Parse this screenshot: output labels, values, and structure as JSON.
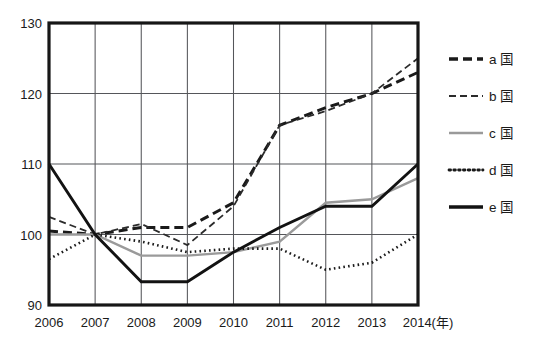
{
  "chart_data": {
    "type": "line",
    "title": "",
    "xlabel": "(年)",
    "ylabel": "",
    "x": [
      2006,
      2007,
      2008,
      2009,
      2010,
      2011,
      2012,
      2013,
      2014
    ],
    "categories": [
      "2006",
      "2007",
      "2008",
      "2009",
      "2010",
      "2011",
      "2012",
      "2013",
      "2014"
    ],
    "xlim": [
      2006,
      2014
    ],
    "ylim": [
      90,
      130
    ],
    "yticks": [
      90,
      100,
      110,
      120,
      130
    ],
    "ytick_labels": [
      "90",
      "100",
      "110",
      "120",
      "130"
    ],
    "grid": true,
    "legend_position": "right",
    "series": [
      {
        "name": "a 国",
        "label": "a 国",
        "style": "thick-dashed",
        "color": "#1a1a1a",
        "width": 3.0,
        "dash": "9,5",
        "values": [
          100.5,
          100,
          101,
          101,
          104.5,
          115.5,
          118,
          120,
          123
        ]
      },
      {
        "name": "b 国",
        "label": "b 国",
        "style": "thin-dashed",
        "color": "#2b2b2b",
        "width": 1.8,
        "dash": "7,4",
        "values": [
          102.5,
          100,
          101.5,
          98.5,
          104,
          115.5,
          117.5,
          120,
          125
        ]
      },
      {
        "name": "c 国",
        "label": "c 国",
        "style": "gray-solid",
        "color": "#9a9a9a",
        "width": 2.4,
        "dash": "none",
        "values": [
          100,
          100,
          97,
          97,
          97.5,
          99,
          104.5,
          105,
          108
        ]
      },
      {
        "name": "d 国",
        "label": "d 国",
        "style": "dotted",
        "color": "#1a1a1a",
        "width": 2.6,
        "dash": "1.6,3.2",
        "values": [
          96.5,
          100,
          99,
          97.5,
          98,
          98,
          95,
          96,
          100
        ]
      },
      {
        "name": "e 国",
        "label": "e 国",
        "style": "thick-solid",
        "color": "#121212",
        "width": 2.9,
        "dash": "none",
        "values": [
          110,
          100,
          93.3,
          93.3,
          97.5,
          101,
          104,
          104,
          110
        ]
      }
    ],
    "legend": [
      {
        "label": "a 国",
        "style": "thick-dashed",
        "color": "#1a1a1a",
        "width": 3.6,
        "dash": "9,5"
      },
      {
        "label": "b 国",
        "style": "thin-dashed",
        "color": "#2b2b2b",
        "width": 2.0,
        "dash": "7,4"
      },
      {
        "label": "c 国",
        "style": "gray-solid",
        "color": "#9a9a9a",
        "width": 2.4,
        "dash": "none"
      },
      {
        "label": "d 国",
        "style": "dotted",
        "color": "#1a1a1a",
        "width": 2.8,
        "dash": "1.6,3.2"
      },
      {
        "label": "e 国",
        "style": "thick-solid",
        "color": "#121212",
        "width": 3.6,
        "dash": "none"
      }
    ]
  },
  "layout": {
    "plot_left": 49,
    "plot_right": 418,
    "plot_top": 23,
    "plot_bottom": 305,
    "legend_x": 449,
    "legend_swatch_w": 34,
    "legend_rows_y": [
      59,
      96,
      133,
      170,
      207
    ]
  }
}
